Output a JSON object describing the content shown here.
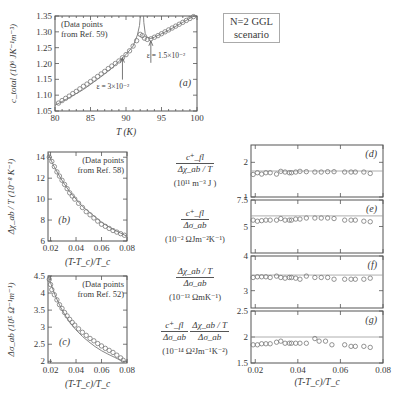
{
  "figure": {
    "scenario_box": [
      "N=2 GGL",
      "scenario"
    ],
    "right_labels": {
      "d": {
        "num": "c⁺_fl",
        "den": "Δχ_ab / T",
        "units": "(10¹¹ m⁻³ J )"
      },
      "e": {
        "num": "c⁺_fl",
        "den": "Δσ_ab",
        "units": "(10⁻² ΩJm⁻²K⁻¹)"
      },
      "f": {
        "num": "Δχ_ab / T",
        "den": "Δσ_ab",
        "units": "(10⁻¹³ ΩmK⁻¹)"
      },
      "g": {
        "num1": "c⁺_fl",
        "den1": "Δσ_ab",
        "num2": "Δχ_ab / T",
        "den2": "Δσ_ab",
        "units": "(10⁻¹⁴ Ω²Jm⁻¹K⁻²)"
      }
    }
  },
  "chart_data": [
    {
      "id": "a",
      "type": "scatter",
      "panel_label": "(a)",
      "title": "",
      "xlabel": "T (K)",
      "ylabel": "c_total (10⁶ JK⁻¹m⁻³)",
      "xlim": [
        80,
        100
      ],
      "ylim": [
        1.05,
        1.35
      ],
      "xticks": [
        80,
        85,
        90,
        95,
        100
      ],
      "yticks": [
        1.05,
        1.1,
        1.15,
        1.2,
        1.25,
        1.3,
        1.35
      ],
      "ytick_labels": [
        "1.05",
        "1.10",
        "1.15",
        "1.20",
        "1.25",
        "1.30",
        "1.35"
      ],
      "annotation": [
        "(Data points",
        "from Ref. 59)"
      ],
      "arrows": [
        {
          "label": "ε = 3×10⁻²",
          "x": 89.5,
          "y": 1.225
        },
        {
          "label": "ε = 1.5×10⁻²",
          "x": 93.5,
          "y": 1.278
        }
      ],
      "series": [
        {
          "name": "data",
          "x": [
            80.5,
            81.0,
            81.5,
            82.0,
            82.5,
            83.0,
            83.5,
            84.0,
            84.5,
            85.0,
            85.5,
            86.0,
            86.5,
            87.0,
            87.5,
            88.0,
            88.5,
            89.0,
            89.5,
            90.0,
            90.5,
            91.0,
            91.5,
            92.0,
            92.3,
            92.6,
            93.0,
            93.5,
            94.0,
            94.5,
            95.0,
            95.5,
            96.0,
            96.5,
            97.0,
            97.5,
            98.0,
            98.5,
            99.0,
            99.5
          ],
          "y": [
            1.075,
            1.083,
            1.09,
            1.097,
            1.105,
            1.112,
            1.12,
            1.128,
            1.135,
            1.143,
            1.151,
            1.159,
            1.167,
            1.175,
            1.184,
            1.192,
            1.2,
            1.208,
            1.218,
            1.228,
            1.24,
            1.255,
            1.272,
            1.292,
            1.288,
            1.28,
            1.276,
            1.278,
            1.283,
            1.288,
            1.294,
            1.3,
            1.306,
            1.312,
            1.318,
            1.324,
            1.33,
            1.336,
            1.342,
            1.348
          ]
        },
        {
          "name": "fit",
          "x": [
            80,
            82,
            84,
            86,
            88,
            90,
            91,
            91.6,
            91.9,
            92.0,
            92.05
          ],
          "y": [
            1.068,
            1.092,
            1.118,
            1.15,
            1.185,
            1.228,
            1.255,
            1.29,
            1.32,
            1.345,
            1.36
          ]
        },
        {
          "name": "fit-above",
          "x": [
            92.45,
            92.5,
            92.7,
            93,
            93.5,
            94,
            96,
            98,
            100
          ],
          "y": [
            1.36,
            1.33,
            1.295,
            1.282,
            1.279,
            1.283,
            1.305,
            1.33,
            1.355
          ]
        }
      ]
    },
    {
      "id": "b",
      "type": "scatter",
      "panel_label": "(b)",
      "xlabel": "(T-T_c)/T_c",
      "ylabel": "Δχ_ab / T (10⁻⁸ K⁻¹)",
      "xlim": [
        0.018,
        0.08
      ],
      "ylim": [
        6,
        14.5
      ],
      "xticks": [
        0.02,
        0.04,
        0.06,
        0.08
      ],
      "xtick_labels": [
        "0.02",
        "0.04",
        "0.06",
        "0.08"
      ],
      "yticks": [
        6,
        8,
        10,
        12,
        14
      ],
      "annotation": [
        "(Data points",
        "from Ref. 58)"
      ],
      "series": [
        {
          "name": "data",
          "x": [
            0.019,
            0.021,
            0.023,
            0.025,
            0.027,
            0.029,
            0.031,
            0.033,
            0.035,
            0.037,
            0.039,
            0.042,
            0.045,
            0.048,
            0.051,
            0.054,
            0.057,
            0.06,
            0.063,
            0.066,
            0.069,
            0.072,
            0.075,
            0.078
          ],
          "y": [
            14.0,
            13.6,
            13.1,
            12.6,
            12.2,
            11.8,
            11.4,
            11.0,
            10.6,
            10.3,
            10.0,
            9.6,
            9.2,
            8.8,
            8.5,
            8.2,
            7.9,
            7.6,
            7.4,
            7.2,
            7.0,
            6.85,
            6.7,
            6.55
          ]
        },
        {
          "name": "fit",
          "x": [
            0.018,
            0.022,
            0.026,
            0.03,
            0.035,
            0.04,
            0.045,
            0.05,
            0.055,
            0.06,
            0.065,
            0.07,
            0.075,
            0.08
          ],
          "y": [
            14.4,
            13.3,
            12.4,
            11.6,
            10.7,
            10.0,
            9.3,
            8.8,
            8.3,
            7.8,
            7.4,
            7.05,
            6.75,
            6.45
          ]
        }
      ]
    },
    {
      "id": "c",
      "type": "scatter",
      "panel_label": "(c)",
      "xlabel": "(T-T_c)/T_c",
      "ylabel": "Δσ_ab (10⁵ Ω⁻¹m⁻¹)",
      "xlim": [
        0.018,
        0.08
      ],
      "ylim": [
        1.95,
        4.5
      ],
      "xticks": [
        0.02,
        0.04,
        0.06,
        0.08
      ],
      "xtick_labels": [
        "0.02",
        "0.04",
        "0.06",
        "0.08"
      ],
      "yticks": [
        2,
        2.5,
        3,
        3.5,
        4,
        4.5
      ],
      "ytick_labels": [
        "2",
        "2.5",
        "3",
        "3.5",
        "4",
        "4.5"
      ],
      "annotation": [
        "(Data points",
        "from Ref. 52)"
      ],
      "series": [
        {
          "name": "data",
          "x": [
            0.019,
            0.02,
            0.021,
            0.023,
            0.025,
            0.027,
            0.029,
            0.031,
            0.033,
            0.035,
            0.037,
            0.039,
            0.042,
            0.045,
            0.048,
            0.051,
            0.054,
            0.057,
            0.06,
            0.063,
            0.066,
            0.069,
            0.072,
            0.075,
            0.077
          ],
          "y": [
            4.4,
            4.25,
            4.1,
            3.95,
            3.8,
            3.66,
            3.55,
            3.43,
            3.33,
            3.23,
            3.14,
            3.06,
            2.95,
            2.85,
            2.76,
            2.67,
            2.6,
            2.52,
            2.45,
            2.38,
            2.32,
            2.26,
            2.18,
            2.1,
            2.03
          ]
        },
        {
          "name": "fit",
          "x": [
            0.018,
            0.02,
            0.024,
            0.028,
            0.032,
            0.036,
            0.04,
            0.045,
            0.05,
            0.055,
            0.06,
            0.065,
            0.07,
            0.075,
            0.078
          ],
          "y": [
            4.55,
            4.3,
            3.9,
            3.58,
            3.32,
            3.1,
            2.92,
            2.73,
            2.57,
            2.43,
            2.31,
            2.21,
            2.12,
            2.03,
            1.98
          ]
        }
      ]
    },
    {
      "id": "d",
      "type": "scatter",
      "panel_label": "(d)",
      "xlim": [
        0.018,
        0.08
      ],
      "ylim": [
        1,
        2.5
      ],
      "yticks": [
        1,
        2
      ],
      "ref_line": 1.75,
      "series": [
        {
          "name": "data",
          "x": [
            0.019,
            0.021,
            0.023,
            0.025,
            0.027,
            0.03,
            0.032,
            0.034,
            0.036,
            0.037,
            0.039,
            0.041,
            0.044,
            0.048,
            0.051,
            0.054,
            0.057,
            0.062,
            0.065,
            0.067,
            0.071,
            0.074
          ],
          "y": [
            1.65,
            1.7,
            1.66,
            1.7,
            1.7,
            1.66,
            1.74,
            1.72,
            1.7,
            1.7,
            1.72,
            1.74,
            1.73,
            1.72,
            1.72,
            1.73,
            1.73,
            1.72,
            1.72,
            1.72,
            1.72,
            1.68
          ]
        }
      ]
    },
    {
      "id": "e",
      "type": "scatter",
      "panel_label": "(e)",
      "xlim": [
        0.018,
        0.08
      ],
      "ylim": [
        2.5,
        7.5
      ],
      "yticks": [
        5,
        7.5
      ],
      "ytick_labels": [
        "5",
        "7.5"
      ],
      "ref_line": 6.0,
      "series": [
        {
          "name": "data",
          "x": [
            0.019,
            0.021,
            0.023,
            0.025,
            0.027,
            0.03,
            0.032,
            0.034,
            0.036,
            0.037,
            0.039,
            0.041,
            0.044,
            0.048,
            0.051,
            0.054,
            0.057,
            0.062,
            0.065,
            0.067,
            0.071,
            0.074
          ],
          "y": [
            5.6,
            5.5,
            5.55,
            5.6,
            5.6,
            5.6,
            5.75,
            5.6,
            5.6,
            5.6,
            5.7,
            5.7,
            5.8,
            5.8,
            5.8,
            5.8,
            5.75,
            5.6,
            5.6,
            5.6,
            5.5,
            5.45
          ]
        }
      ]
    },
    {
      "id": "f",
      "type": "scatter",
      "panel_label": "(f)",
      "xlim": [
        0.018,
        0.08
      ],
      "ylim": [
        2.5,
        4
      ],
      "yticks": [
        3,
        4
      ],
      "ref_line": 3.45,
      "series": [
        {
          "name": "data",
          "x": [
            0.019,
            0.021,
            0.023,
            0.025,
            0.027,
            0.03,
            0.032,
            0.034,
            0.036,
            0.037,
            0.039,
            0.041,
            0.044,
            0.048,
            0.051,
            0.054,
            0.057,
            0.062,
            0.065,
            0.067,
            0.071,
            0.074
          ],
          "y": [
            3.38,
            3.4,
            3.4,
            3.4,
            3.38,
            3.42,
            3.38,
            3.36,
            3.38,
            3.38,
            3.36,
            3.33,
            3.42,
            3.38,
            3.38,
            3.38,
            3.33,
            3.33,
            3.33,
            3.33,
            3.33,
            3.36
          ]
        }
      ]
    },
    {
      "id": "g",
      "type": "scatter",
      "panel_label": "(g)",
      "xlabel": "(T-T_c)/T_c",
      "xlim": [
        0.018,
        0.08
      ],
      "ylim": [
        1.5,
        2.5
      ],
      "yticks": [
        1.5,
        2,
        2.5
      ],
      "ytick_labels": [
        "1.5",
        "2",
        "2.5"
      ],
      "xticks": [
        0.02,
        0.04,
        0.06,
        0.08
      ],
      "xtick_labels": [
        "0.02",
        "0.04",
        "0.06",
        "0.08"
      ],
      "ref_line": 2.0,
      "series": [
        {
          "name": "data",
          "x": [
            0.019,
            0.021,
            0.023,
            0.025,
            0.027,
            0.03,
            0.032,
            0.034,
            0.036,
            0.037,
            0.039,
            0.041,
            0.044,
            0.048,
            0.05,
            0.053,
            0.056,
            0.062,
            0.065,
            0.067,
            0.071,
            0.074
          ],
          "y": [
            1.85,
            1.85,
            1.87,
            1.87,
            1.87,
            1.9,
            1.92,
            1.88,
            1.88,
            1.88,
            1.88,
            1.88,
            1.88,
            1.97,
            1.92,
            1.92,
            1.85,
            1.85,
            1.82,
            1.82,
            1.82,
            1.8
          ]
        }
      ]
    }
  ]
}
